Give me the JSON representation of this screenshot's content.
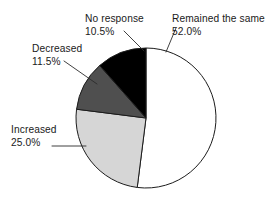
{
  "chart_data": {
    "type": "pie",
    "title": "",
    "subtitle": "",
    "xlabel": "",
    "ylabel": "",
    "legend_position": "none",
    "grid": false,
    "units": "percent",
    "categories": [
      "Remained the same",
      "No response",
      "Decreased",
      "Increased"
    ],
    "values": [
      52.0,
      10.5,
      11.5,
      25.0
    ],
    "slices": [
      {
        "label": "Remained the same",
        "value": 52.0,
        "value_text": "52.0%",
        "color": "#ffffff",
        "start_angle_deg": 0,
        "end_angle_deg": 187.2
      },
      {
        "label": "Increased",
        "value": 25.0,
        "value_text": "25.0%",
        "color": "#d6d6d6",
        "start_angle_deg": 187.2,
        "end_angle_deg": 277.2
      },
      {
        "label": "Decreased",
        "value": 11.5,
        "value_text": "11.5%",
        "color": "#4f4f4f",
        "start_angle_deg": 277.2,
        "end_angle_deg": 318.6
      },
      {
        "label": "No response",
        "value": 10.5,
        "value_text": "10.5%",
        "color": "#000000",
        "start_angle_deg": 318.6,
        "end_angle_deg": 360
      }
    ],
    "annotations": [
      {
        "name": "remained-the-same",
        "line1": "Remained the same",
        "line2": "52.0%",
        "text_x": 172,
        "text_y": 22,
        "anchor": "start",
        "leader": [
          [
            176,
            28
          ],
          [
            166,
            52
          ]
        ]
      },
      {
        "name": "no-response",
        "line1": "No response",
        "line2": "10.5%",
        "text_x": 85,
        "text_y": 22,
        "anchor": "start",
        "leader": [
          [
            124,
            31
          ],
          [
            144,
            51
          ]
        ]
      },
      {
        "name": "decreased",
        "line1": "Decreased",
        "line2": "11.5%",
        "text_x": 32,
        "text_y": 52,
        "anchor": "start",
        "leader": [
          [
            64,
            61
          ],
          [
            97,
            84
          ]
        ]
      },
      {
        "name": "increased",
        "line1": "Increased",
        "line2": "25.0%",
        "text_x": 11,
        "text_y": 133,
        "anchor": "start",
        "leader": [
          [
            52,
            146
          ],
          [
            86,
            146
          ]
        ]
      }
    ],
    "geometry": {
      "center_x": 146,
      "center_y": 118,
      "radius": 70,
      "start_at_top": true,
      "direction": "counterclockwise_for_gray_slices"
    },
    "colors": {
      "remained_the_same": "#ffffff",
      "increased": "#d6d6d6",
      "decreased": "#4f4f4f",
      "no_response": "#000000",
      "outline": "#1c1c1c",
      "text": "#1a1a1a",
      "background": "#ffffff"
    }
  }
}
